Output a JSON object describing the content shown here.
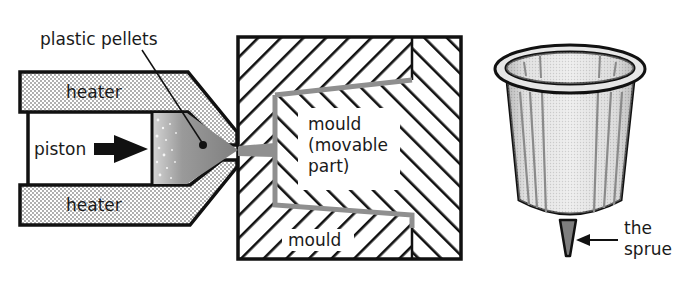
{
  "diagram": {
    "labels": {
      "plastic_pellets": "plastic pellets",
      "heater_top": "heater",
      "heater_bottom": "heater",
      "piston": "piston",
      "mould_movable_line1": "mould",
      "mould_movable_line2": "(movable",
      "mould_movable_line3": "part)",
      "mould_fixed": "mould",
      "sprue_line1": "the",
      "sprue_line2": "sprue"
    },
    "colors": {
      "outline": "#111111",
      "plastic_fill": "#8c8c8c",
      "heater_dots": "#9a9a9a",
      "hatch": "#111111",
      "cavity": "#8f8f8f",
      "background": "#ffffff"
    },
    "components": [
      {
        "name": "heater-top",
        "type": "dotted-block"
      },
      {
        "name": "heater-bottom",
        "type": "dotted-block"
      },
      {
        "name": "piston",
        "type": "arrow"
      },
      {
        "name": "plastic-chamber",
        "type": "molten-plastic"
      },
      {
        "name": "mould-fixed",
        "type": "hatched-block"
      },
      {
        "name": "mould-movable",
        "type": "hatched-block"
      },
      {
        "name": "moulded-cup",
        "type": "product"
      },
      {
        "name": "sprue",
        "type": "product-detail"
      }
    ]
  }
}
